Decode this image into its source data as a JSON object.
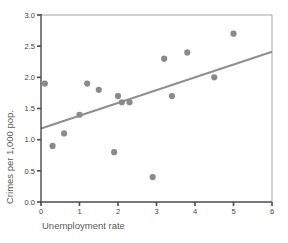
{
  "figure": {
    "background": "#ffffff"
  },
  "chart_data": {
    "type": "scatter",
    "title": "",
    "xlabel": "Unemployment rate",
    "ylabel": "Crimes per 1,000 pop.",
    "xlim": [
      0,
      6
    ],
    "ylim": [
      0.0,
      3.0
    ],
    "xticks": [
      "0",
      "1",
      "2",
      "3",
      "4",
      "5",
      "6"
    ],
    "yticks": [
      "0.0",
      "0.5",
      "1.0",
      "1.5",
      "2.0",
      "2.5",
      "3.0"
    ],
    "grid": false,
    "legend": null,
    "points": [
      {
        "x": 0.1,
        "y": 1.9
      },
      {
        "x": 0.3,
        "y": 0.9
      },
      {
        "x": 0.6,
        "y": 1.1
      },
      {
        "x": 1.0,
        "y": 1.4
      },
      {
        "x": 1.2,
        "y": 1.9
      },
      {
        "x": 1.5,
        "y": 1.8
      },
      {
        "x": 1.9,
        "y": 0.8
      },
      {
        "x": 2.0,
        "y": 1.7
      },
      {
        "x": 2.1,
        "y": 1.6
      },
      {
        "x": 2.3,
        "y": 1.6
      },
      {
        "x": 2.9,
        "y": 0.4
      },
      {
        "x": 3.2,
        "y": 2.3
      },
      {
        "x": 3.4,
        "y": 1.7
      },
      {
        "x": 3.8,
        "y": 2.4
      },
      {
        "x": 4.5,
        "y": 2.0
      },
      {
        "x": 5.0,
        "y": 2.7
      }
    ],
    "trend_line": {
      "x1": 0,
      "y1": 1.18,
      "x2": 6,
      "y2": 2.41
    },
    "colors": {
      "point": "#8a8a8a",
      "trend": "#8f8f8f",
      "axis": "#4a4a4a",
      "border": "#a3a3a3",
      "axis_title_text": "#5a5a5a",
      "tick_text": "#3f3f3f"
    }
  }
}
